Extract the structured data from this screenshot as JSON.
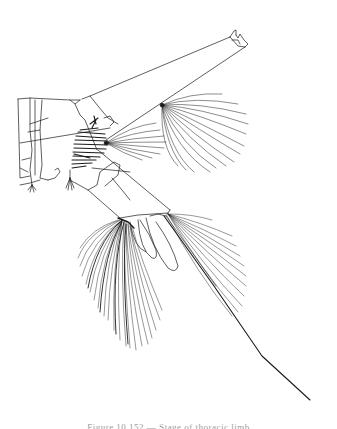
{
  "figure": {
    "line_color": "#1a1a1a",
    "background": "#ffffff",
    "parts": [
      {
        "name": "body-segments",
        "label": ""
      },
      {
        "name": "upper-limb",
        "label": ""
      },
      {
        "name": "upper-setae-fan",
        "label": ""
      },
      {
        "name": "lower-limb",
        "label": ""
      },
      {
        "name": "lower-dense-setae-fan",
        "label": ""
      },
      {
        "name": "long-terminal-seta",
        "label": ""
      }
    ]
  },
  "caption": {
    "text": "Figure 10.152 — Stage of thoracic limb"
  }
}
